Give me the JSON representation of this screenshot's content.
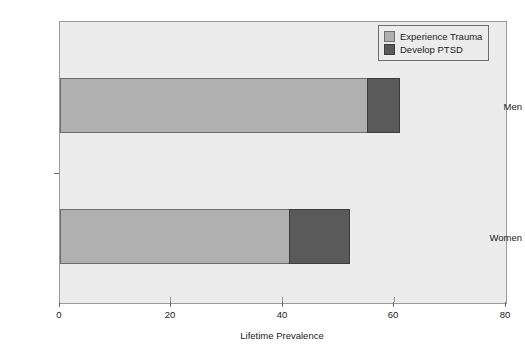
{
  "chart_data": {
    "type": "bar",
    "orientation": "horizontal",
    "stacked": true,
    "title": "",
    "xlabel": "Lifetime Prevalence",
    "ylabel": "",
    "xlim": [
      0,
      80
    ],
    "xticks": [
      0,
      20,
      40,
      60,
      80
    ],
    "xtick_labels": [
      "0",
      "20",
      "40",
      "60",
      "80"
    ],
    "grid": false,
    "legend_position": "top-right",
    "categories": [
      "Men",
      "Women"
    ],
    "series": [
      {
        "name": "Experience Trauma",
        "color": "#b0b0b0",
        "values": [
          55,
          41
        ]
      },
      {
        "name": "Develop PTSD",
        "color": "#5a5a5a",
        "values": [
          6,
          11
        ]
      }
    ],
    "totals": [
      61,
      52
    ],
    "segment_ends": {
      "Men": {
        "trauma_end": 55,
        "ptsd_end": 61
      },
      "Women": {
        "trauma_end": 41,
        "ptsd_end": 52
      }
    }
  },
  "legend": {
    "items": [
      {
        "label": "Experience Trauma",
        "swatch": "legend-swatch-trauma"
      },
      {
        "label": "Develop PTSD",
        "swatch": "legend-swatch-ptsd"
      }
    ]
  },
  "axes": {
    "x_title": "Lifetime Prevalence",
    "x_tick_labels": [
      "0",
      "20",
      "40",
      "60",
      "80"
    ],
    "y_tick_labels": [
      "Men",
      "Women"
    ]
  },
  "colors": {
    "plot_background": "#ececec",
    "page_background": "#ffffff",
    "frame": "#9a9a9a",
    "trauma": "#b0b0b0",
    "ptsd": "#5a5a5a",
    "text": "#1a1a1a"
  }
}
